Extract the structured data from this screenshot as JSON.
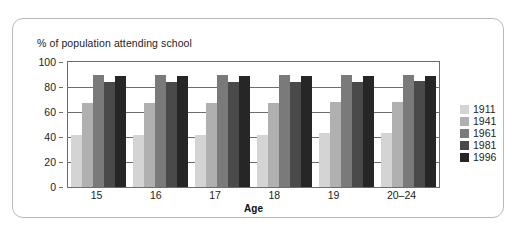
{
  "chart_data": {
    "type": "bar",
    "title": "% of population attending school",
    "xlabel": "Age",
    "ylabel": "",
    "ylim": [
      0,
      100
    ],
    "yticks": [
      0,
      20,
      40,
      60,
      80,
      100
    ],
    "grid": true,
    "legend_position": "right",
    "categories": [
      "15",
      "16",
      "17",
      "18",
      "19",
      "20–24"
    ],
    "series": [
      {
        "name": "1911",
        "color": "#d4d4d4",
        "values": [
          42,
          42,
          42,
          42,
          43,
          43
        ]
      },
      {
        "name": "1941",
        "color": "#b0b0b0",
        "values": [
          67,
          67,
          67,
          67,
          68,
          68
        ]
      },
      {
        "name": "1961",
        "color": "#7a7a7a",
        "values": [
          90,
          90,
          90,
          90,
          90,
          90
        ]
      },
      {
        "name": "1981",
        "color": "#4a4a4a",
        "values": [
          84,
          84,
          84,
          84,
          84,
          85
        ]
      },
      {
        "name": "1996",
        "color": "#262626",
        "values": [
          89,
          89,
          89,
          89,
          89,
          89
        ]
      }
    ]
  }
}
